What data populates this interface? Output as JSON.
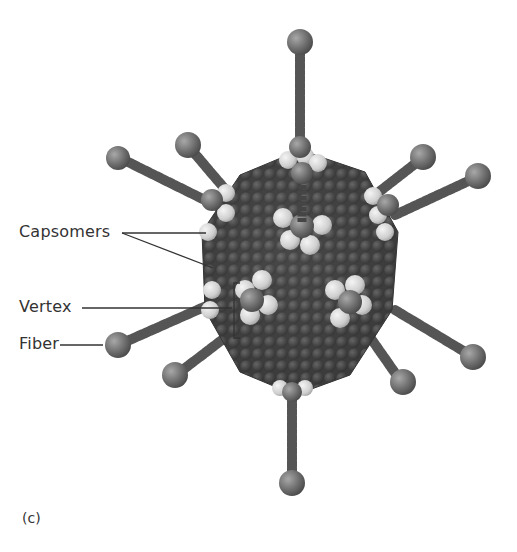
{
  "figure": {
    "panel_label": "(c)",
    "labels": [
      {
        "id": "capsomers",
        "text": "Capsomers"
      },
      {
        "id": "vertex",
        "text": "Vertex"
      },
      {
        "id": "fiber",
        "text": "Fiber"
      }
    ],
    "colors": {
      "capsomer_dark": "#4a4a4a",
      "capsomer_light": "#d9d9d9",
      "fiber": "#5a5a5a",
      "fiber_knob": "#777777",
      "leader_line": "#333333",
      "text": "#333333"
    }
  }
}
